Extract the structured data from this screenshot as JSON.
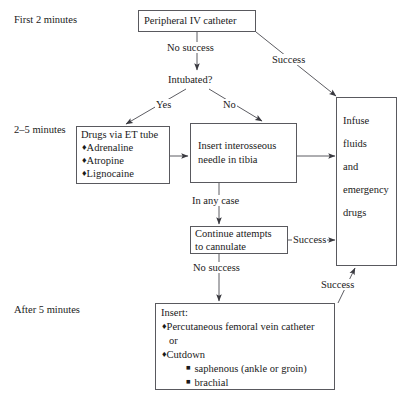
{
  "diagram": {
    "type": "flowchart",
    "stage_labels": [
      {
        "id": "stage-first-2-minutes",
        "text": "First 2 minutes"
      },
      {
        "id": "stage-2-5-minutes",
        "text": "2–5 minutes"
      },
      {
        "id": "stage-after-5-minutes",
        "text": "After 5 minutes"
      }
    ],
    "nodes": {
      "peripheral_iv": {
        "id": "node-peripheral-iv-catheter",
        "text": "Peripheral IV catheter",
        "shape": "box"
      },
      "intubated": {
        "id": "node-intubated-decision",
        "text": "Intubated?",
        "shape": "plain"
      },
      "drugs_et": {
        "id": "node-drugs-via-et-tube",
        "shape": "box",
        "heading": "Drugs via ET tube",
        "items": [
          "Adrenaline",
          "Atropine",
          "Lignocaine"
        ],
        "bullet": "♦"
      },
      "interosseous": {
        "id": "node-insert-interosseous-needle",
        "shape": "box",
        "lines": [
          "Insert interosseous",
          "needle in tibia"
        ]
      },
      "continue_attempts": {
        "id": "node-continue-attempts-to-cannulate",
        "shape": "box",
        "lines": [
          "Continue attempts",
          "to cannulate"
        ]
      },
      "infuse": {
        "id": "node-infuse-fluids-and-emergency-drugs",
        "shape": "box",
        "lines": [
          "Infuse",
          "fluids",
          "and",
          "emergency",
          "drugs"
        ]
      },
      "insert_final": {
        "id": "node-insert-femoral-or-cutdown",
        "shape": "box",
        "heading": "Insert:",
        "items": [
          {
            "bullet": "♦",
            "text": "Percutaneous femoral vein catheter",
            "level": 1
          },
          {
            "bullet": "",
            "text": "or",
            "level": 1
          },
          {
            "bullet": "♦",
            "text": "Cutdown",
            "level": 1
          },
          {
            "bullet": "■",
            "text": "saphenous (ankle or groin)",
            "level": 2
          },
          {
            "bullet": "■",
            "text": "brachial",
            "level": 2
          }
        ]
      }
    },
    "edge_labels": [
      {
        "id": "edge-label-no-success-top",
        "text": "No success"
      },
      {
        "id": "edge-label-success-top-right",
        "text": "Success"
      },
      {
        "id": "edge-label-yes",
        "text": "Yes"
      },
      {
        "id": "edge-label-no",
        "text": "No"
      },
      {
        "id": "edge-label-in-any-case",
        "text": "In any case"
      },
      {
        "id": "edge-label-success-middle-right",
        "text": "Success"
      },
      {
        "id": "edge-label-no-success-bottom",
        "text": "No success"
      },
      {
        "id": "edge-label-success-bottom-right",
        "text": "Success"
      }
    ],
    "colors": {
      "background": "#ffffff",
      "ink": "#1a1a1a",
      "border": "#59595e",
      "edge": "#4a4a50"
    }
  }
}
